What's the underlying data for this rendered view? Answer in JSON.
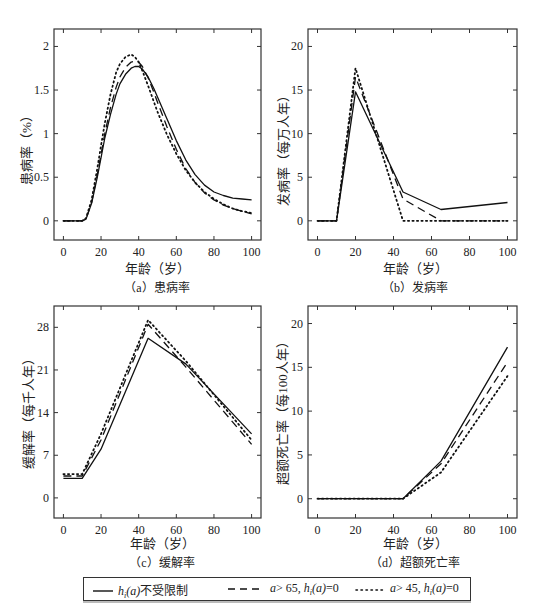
{
  "figure": {
    "legend": [
      {
        "id": "unrestricted",
        "style": "solid",
        "label_pre": "h",
        "label_sub": "i",
        "label_mid": "(a)",
        "label_post": "不受限制",
        "text": "h_i(a)不受限制"
      },
      {
        "id": "a_gt_65",
        "style": "dashed",
        "text": "a> 65, h_i(a)=0",
        "label_pre": "a",
        "label_mid": "> 65, ",
        "label_h": "h",
        "label_sub": "i",
        "label_arg": "(a)",
        "label_post": "=0"
      },
      {
        "id": "a_gt_45",
        "style": "dotted",
        "text": "a> 45, h_i(a)=0",
        "label_pre": "a",
        "label_mid": "> 45, ",
        "label_h": "h",
        "label_sub": "i",
        "label_arg": "(a)",
        "label_post": "=0"
      }
    ]
  },
  "chart_data": [
    {
      "id": "a",
      "type": "line",
      "title": "(a) 患病率",
      "caption_prefix": "（a）",
      "caption_text": "患病率",
      "xlabel": "年龄（岁）",
      "ylabel": "患病率（%）",
      "xlim": [
        -5,
        105
      ],
      "ylim": [
        -0.22,
        2.2
      ],
      "xticks": [
        0,
        20,
        40,
        60,
        80,
        100
      ],
      "yticks": [
        0,
        0.5,
        1,
        1.5,
        2
      ],
      "ytick_labels": [
        "0",
        "0.5",
        "1",
        "1.5",
        "2"
      ],
      "grid": false,
      "series": [
        {
          "name": "h_i(a)不受限制",
          "style": "solid",
          "x": [
            0,
            10,
            12,
            15,
            18,
            20,
            22,
            25,
            28,
            30,
            33,
            36,
            38,
            40,
            42,
            45,
            48,
            50,
            55,
            60,
            65,
            70,
            75,
            80,
            85,
            90,
            95,
            100
          ],
          "y": [
            0,
            0,
            0.02,
            0.2,
            0.5,
            0.72,
            0.95,
            1.22,
            1.45,
            1.57,
            1.68,
            1.75,
            1.77,
            1.77,
            1.74,
            1.65,
            1.52,
            1.42,
            1.17,
            0.92,
            0.7,
            0.53,
            0.41,
            0.33,
            0.29,
            0.26,
            0.25,
            0.24
          ]
        },
        {
          "name": "a> 65, h_i(a)=0",
          "style": "dashed",
          "x": [
            0,
            10,
            12,
            15,
            18,
            20,
            22,
            25,
            28,
            30,
            33,
            36,
            38,
            40,
            42,
            45,
            48,
            50,
            55,
            60,
            65,
            70,
            75,
            80,
            85,
            90,
            95,
            100
          ],
          "y": [
            0,
            0,
            0.02,
            0.21,
            0.53,
            0.76,
            1.0,
            1.3,
            1.53,
            1.65,
            1.76,
            1.82,
            1.83,
            1.82,
            1.77,
            1.64,
            1.48,
            1.36,
            1.08,
            0.82,
            0.6,
            0.44,
            0.32,
            0.24,
            0.18,
            0.14,
            0.11,
            0.08
          ]
        },
        {
          "name": "a> 45, h_i(a)=0",
          "style": "dotted",
          "x": [
            0,
            10,
            12,
            15,
            18,
            20,
            22,
            25,
            28,
            30,
            33,
            36,
            38,
            40,
            42,
            45,
            48,
            50,
            55,
            60,
            65,
            70,
            75,
            80,
            85,
            90,
            95,
            100
          ],
          "y": [
            0,
            0,
            0.03,
            0.24,
            0.6,
            0.86,
            1.12,
            1.45,
            1.7,
            1.8,
            1.88,
            1.91,
            1.88,
            1.82,
            1.72,
            1.55,
            1.37,
            1.25,
            0.99,
            0.77,
            0.58,
            0.44,
            0.33,
            0.25,
            0.19,
            0.14,
            0.11,
            0.09
          ]
        }
      ]
    },
    {
      "id": "b",
      "type": "line",
      "title": "(b) 发病率",
      "caption_prefix": "（b）",
      "caption_text": "发病率",
      "xlabel": "年龄（岁）",
      "ylabel": "发病率（每万人年）",
      "xlim": [
        -5,
        105
      ],
      "ylim": [
        -2.2,
        22
      ],
      "xticks": [
        0,
        20,
        40,
        60,
        80,
        100
      ],
      "yticks": [
        0,
        5,
        10,
        15,
        20
      ],
      "ytick_labels": [
        "0",
        "5",
        "10",
        "15",
        "20"
      ],
      "grid": false,
      "series": [
        {
          "name": "h_i(a)不受限制",
          "style": "solid",
          "x": [
            0,
            10,
            20,
            45,
            65,
            100
          ],
          "y": [
            0,
            0,
            14.8,
            3.3,
            1.3,
            2.1
          ]
        },
        {
          "name": "a> 65, h_i(a)=0",
          "style": "dashed",
          "x": [
            0,
            10,
            20,
            45,
            65,
            100
          ],
          "y": [
            0,
            0,
            16.5,
            2.5,
            0,
            0
          ]
        },
        {
          "name": "a> 45, h_i(a)=0",
          "style": "dotted",
          "x": [
            0,
            10,
            20,
            45,
            65,
            100
          ],
          "y": [
            0,
            0,
            17.5,
            0,
            0,
            0
          ]
        }
      ]
    },
    {
      "id": "c",
      "type": "line",
      "title": "(c) 缓解率",
      "caption_prefix": "（c）",
      "caption_text": "缓解率",
      "xlabel": "年龄（岁）",
      "ylabel": "缓解率（每千人年）",
      "xlim": [
        -5,
        105
      ],
      "ylim": [
        -3.3,
        31.5
      ],
      "xticks": [
        0,
        20,
        40,
        60,
        80,
        100
      ],
      "yticks": [
        0,
        7,
        14,
        21,
        28
      ],
      "ytick_labels": [
        "0",
        "7",
        "14",
        "21",
        "28"
      ],
      "grid": false,
      "series": [
        {
          "name": "h_i(a)不受限制",
          "style": "solid",
          "x": [
            0,
            10,
            20,
            45,
            65,
            100
          ],
          "y": [
            3.2,
            3.2,
            8,
            26.2,
            22,
            10.5
          ]
        },
        {
          "name": "a> 65, h_i(a)=0",
          "style": "dashed",
          "x": [
            0,
            10,
            20,
            45,
            65,
            100
          ],
          "y": [
            3.6,
            3.6,
            9.5,
            28.5,
            21.5,
            8.8
          ]
        },
        {
          "name": "a> 45, h_i(a)=0",
          "style": "dotted",
          "x": [
            0,
            10,
            20,
            45,
            65,
            100
          ],
          "y": [
            3.9,
            3.9,
            10.5,
            29.2,
            22.5,
            9.5
          ]
        }
      ]
    },
    {
      "id": "d",
      "type": "line",
      "title": "(d) 超额死亡率",
      "caption_prefix": "（d）",
      "caption_text": "超额死亡率",
      "xlabel": "年龄（岁）",
      "ylabel": "超额死亡率（每100人年）",
      "xlim": [
        -5,
        105
      ],
      "ylim": [
        -2.2,
        22
      ],
      "xticks": [
        0,
        20,
        40,
        60,
        80,
        100
      ],
      "yticks": [
        0,
        5,
        10,
        15,
        20
      ],
      "ytick_labels": [
        "0",
        "5",
        "10",
        "15",
        "20"
      ],
      "grid": false,
      "series": [
        {
          "name": "h_i(a)不受限制",
          "style": "solid",
          "x": [
            0,
            45,
            65,
            100
          ],
          "y": [
            0,
            0,
            4.3,
            17.3
          ]
        },
        {
          "name": "a> 65, h_i(a)=0",
          "style": "dashed",
          "x": [
            0,
            45,
            65,
            100
          ],
          "y": [
            0,
            0,
            4.0,
            15.6
          ]
        },
        {
          "name": "a> 45, h_i(a)=0",
          "style": "dotted",
          "x": [
            0,
            45,
            65,
            100
          ],
          "y": [
            0,
            0,
            3.0,
            14.0
          ]
        }
      ]
    }
  ]
}
